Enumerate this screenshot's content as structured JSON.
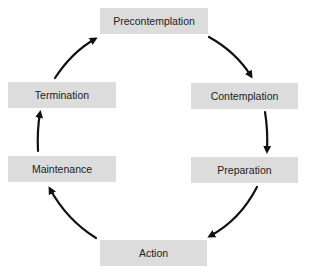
{
  "diagram": {
    "type": "cycle",
    "stages": [
      {
        "id": "precontemplation",
        "label": "Precontemplation"
      },
      {
        "id": "contemplation",
        "label": "Contemplation"
      },
      {
        "id": "preparation",
        "label": "Preparation"
      },
      {
        "id": "action",
        "label": "Action"
      },
      {
        "id": "maintenance",
        "label": "Maintenance"
      },
      {
        "id": "termination",
        "label": "Termination"
      }
    ],
    "edges": [
      {
        "from": "precontemplation",
        "to": "contemplation"
      },
      {
        "from": "contemplation",
        "to": "preparation"
      },
      {
        "from": "preparation",
        "to": "action"
      },
      {
        "from": "action",
        "to": "maintenance"
      },
      {
        "from": "maintenance",
        "to": "termination"
      },
      {
        "from": "termination",
        "to": "precontemplation"
      }
    ],
    "colors": {
      "box_fill": "#dcdcdc",
      "arrow": "#111111",
      "text": "#222222"
    }
  }
}
